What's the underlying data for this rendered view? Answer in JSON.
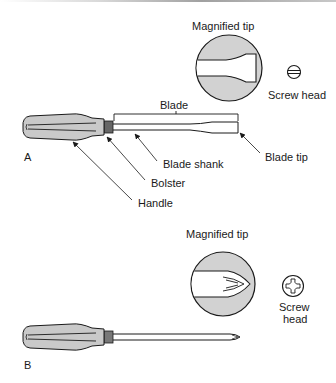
{
  "figure": {
    "panel_a": {
      "label": "A",
      "magnified_tip_label": "Magnified tip",
      "screw_head_label": "Screw head",
      "blade_label": "Blade",
      "blade_shank_label": "Blade shank",
      "blade_tip_label": "Blade tip",
      "bolster_label": "Bolster",
      "handle_label": "Handle",
      "tip_type": "slotted"
    },
    "panel_b": {
      "label": "B",
      "magnified_tip_label": "Magnified tip",
      "screw_head_label_line1": "Screw",
      "screw_head_label_line2": "head",
      "tip_type": "phillips"
    },
    "colors": {
      "stroke": "#1a1a1a",
      "handle_fill": "#c9c9c9",
      "circle_fill": "#d2d2d2",
      "blade_fill": "#ffffff"
    }
  }
}
